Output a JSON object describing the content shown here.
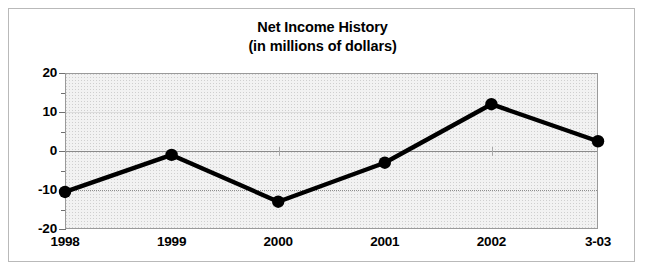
{
  "figure": {
    "background_color": "#ffffff",
    "border_color": "#b9b9b9"
  },
  "chart_data": {
    "type": "line",
    "title": "Net Income History",
    "subtitle": "(in millions of dollars)",
    "xlabel": "",
    "ylabel": "",
    "categories": [
      "1998",
      "1999",
      "2000",
      "2001",
      "2002",
      "3-03"
    ],
    "values": [
      -10.5,
      -1,
      -13,
      -3,
      12,
      2.5
    ],
    "series": [
      {
        "name": "Net Income",
        "values": [
          -10.5,
          -1,
          -13,
          -3,
          12,
          2.5
        ]
      }
    ],
    "ylim": [
      -20,
      20
    ],
    "ytick_labels": [
      "20",
      "10",
      "0",
      "-10",
      "-20"
    ],
    "ytick_values": [
      20,
      10,
      0,
      -10,
      -20
    ],
    "yminor_values": [
      15,
      5,
      -5,
      -15
    ],
    "grid": true,
    "zero_line": true,
    "legend": false,
    "legend_position": "none",
    "line_color": "#000000",
    "marker_color": "#000000",
    "plot_background_color": "#f2f2f2",
    "plot_border_color": "#9a9a9a",
    "gridline_color": "#8e8e8e"
  }
}
